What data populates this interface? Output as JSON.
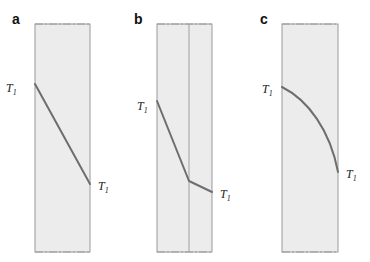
{
  "panels": [
    {
      "letter": "a",
      "profile": "linear",
      "layers": 1,
      "left_label": "T",
      "left_sub": "1",
      "right_label": "T",
      "right_sub": "1"
    },
    {
      "letter": "b",
      "profile": "piecewise-linear",
      "layers": 2,
      "left_label": "T",
      "left_sub": "1",
      "right_label": "T",
      "right_sub": "1"
    },
    {
      "letter": "c",
      "profile": "curved",
      "layers": 1,
      "left_label": "T",
      "left_sub": "1",
      "right_label": "T",
      "right_sub": "1"
    }
  ],
  "colors": {
    "wall_fill": "#ececec",
    "wall_edge": "#9a9a9a",
    "profile_line": "#6e6e6e"
  }
}
